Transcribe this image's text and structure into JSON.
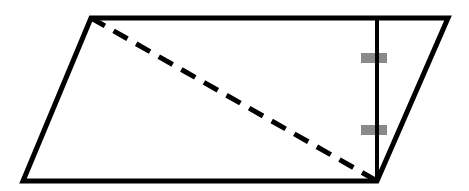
{
  "diagram": {
    "type": "parallelogram-with-height",
    "colors": {
      "stroke": "#000000",
      "tick": "#8a8a8a",
      "background": "#ffffff"
    },
    "vertices": {
      "top_left": [
        91,
        18
      ],
      "top_right": [
        448,
        18
      ],
      "bottom_right": [
        377,
        181
      ],
      "bottom_left": [
        23,
        181
      ]
    },
    "diagonal": {
      "from": "top_left",
      "to": "bottom_right",
      "style": "dashed"
    },
    "height_segment": {
      "x": 377,
      "y1": 18,
      "y2": 181,
      "style": "solid"
    },
    "tick_marks": [
      {
        "y": 58
      },
      {
        "y": 130
      }
    ]
  }
}
